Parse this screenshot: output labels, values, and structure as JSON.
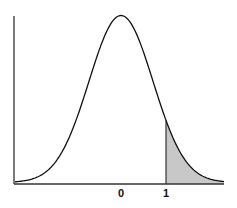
{
  "chart_data": {
    "type": "area",
    "title": "",
    "subtitle": "",
    "xlabel": "",
    "ylabel": "",
    "x_tick_labels": [
      "0",
      "1"
    ],
    "x_ticks": [
      0,
      1
    ],
    "curve": {
      "distribution": "normal",
      "mean": 0,
      "shape": "bell"
    },
    "shaded_region": {
      "from": 1,
      "to": "right tail",
      "color": "#c8c8c8"
    },
    "grid": false,
    "legend": null
  },
  "colors": {
    "line": "#111111",
    "axis": "#333333",
    "shade": "#c8c8c8"
  },
  "layout": {
    "origin_px": {
      "x": 14,
      "y": 184
    },
    "mean_px": 121,
    "unit_px": 45,
    "sigma_px": 32,
    "peak_px": 16,
    "right_px": 224
  }
}
